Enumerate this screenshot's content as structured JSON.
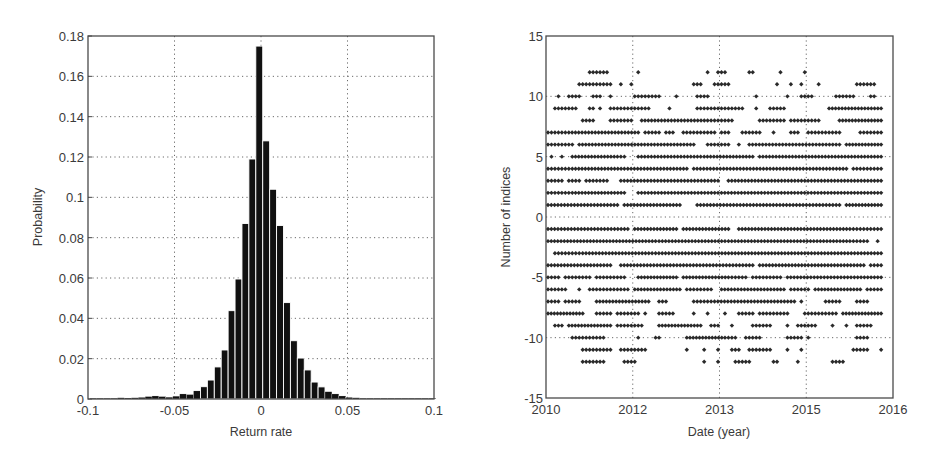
{
  "chart_data": [
    {
      "type": "bar",
      "subtype": "histogram",
      "title": "",
      "xlabel": "Return rate",
      "ylabel": "Probability",
      "xlim": [
        -0.1,
        0.1
      ],
      "ylim": [
        0,
        0.18
      ],
      "xticks": [
        "-0.1",
        "-0.05",
        "0",
        "0.05",
        "0.1"
      ],
      "xtick_values": [
        -0.1,
        -0.05,
        0,
        0.05,
        0.1
      ],
      "yticks": [
        "0",
        "0.02",
        "0.04",
        "0.06",
        "0.08",
        "0.1",
        "0.12",
        "0.14",
        "0.16",
        "0.18"
      ],
      "ytick_values": [
        0,
        0.02,
        0.04,
        0.06,
        0.08,
        0.1,
        0.12,
        0.14,
        0.16,
        0.18
      ],
      "grid": true,
      "bar_color": "#111111",
      "bin_width": 0.004,
      "bin_centers": [
        -0.097,
        -0.093,
        -0.089,
        -0.085,
        -0.081,
        -0.077,
        -0.073,
        -0.069,
        -0.065,
        -0.061,
        -0.057,
        -0.053,
        -0.049,
        -0.045,
        -0.041,
        -0.037,
        -0.033,
        -0.029,
        -0.025,
        -0.021,
        -0.017,
        -0.013,
        -0.009,
        -0.005,
        -0.001,
        0.003,
        0.007,
        0.011,
        0.015,
        0.019,
        0.023,
        0.027,
        0.031,
        0.035,
        0.039,
        0.043,
        0.047,
        0.051,
        0.055,
        0.059,
        0.063,
        0.067,
        0.071,
        0.075,
        0.079,
        0.083,
        0.087,
        0.091,
        0.095,
        0.099
      ],
      "values": [
        0.0003,
        0.0002,
        0.0003,
        0.0004,
        0.0006,
        0.0005,
        0.0006,
        0.0008,
        0.0012,
        0.0015,
        0.0012,
        0.0009,
        0.0014,
        0.0025,
        0.0022,
        0.004,
        0.0061,
        0.0094,
        0.0159,
        0.0243,
        0.0438,
        0.0595,
        0.087,
        0.119,
        0.175,
        0.128,
        0.104,
        0.086,
        0.0478,
        0.0289,
        0.0203,
        0.0144,
        0.0084,
        0.006,
        0.0036,
        0.0025,
        0.0015,
        0.0008,
        0.0006,
        0.0004,
        0.0003,
        0.0003,
        0.0003,
        0.0002,
        0.0004,
        0.0002,
        0.0002,
        0.0002,
        0.0003,
        0.0001
      ]
    },
    {
      "type": "scatter",
      "title": "",
      "xlabel": "Date (year)",
      "ylabel": "Number of indices",
      "xlim_frac": [
        0,
        1
      ],
      "ylim": [
        -15,
        15
      ],
      "xticks": [
        "2010",
        "2012",
        "2013",
        "2015",
        "2016"
      ],
      "xtick_fracs": [
        0,
        0.25,
        0.5,
        0.75,
        1.0
      ],
      "yticks": [
        "-15",
        "-10",
        "-5",
        "0",
        "5",
        "10",
        "15"
      ],
      "ytick_values": [
        -15,
        -10,
        -5,
        0,
        5,
        10,
        15
      ],
      "grid": true,
      "marker_color": "#2a2a2a",
      "marker": "diamond",
      "note": "Each row is an integer y-value; runs are [start,end] as fraction of x-axis width where markers are densely placed (single points when start==end).",
      "rows": [
        {
          "y": 12,
          "runs": [
            [
              0.12,
              0.17
            ],
            [
              0.26,
              0.26
            ],
            [
              0.46,
              0.46
            ],
            [
              0.49,
              0.51
            ],
            [
              0.58,
              0.59
            ],
            [
              0.67,
              0.67
            ],
            [
              0.74,
              0.74
            ]
          ]
        },
        {
          "y": 11,
          "runs": [
            [
              0.09,
              0.18
            ],
            [
              0.21,
              0.21
            ],
            [
              0.24,
              0.24
            ],
            [
              0.42,
              0.44
            ],
            [
              0.48,
              0.52
            ],
            [
              0.66,
              0.66
            ],
            [
              0.7,
              0.7
            ],
            [
              0.73,
              0.73
            ],
            [
              0.78,
              0.78
            ],
            [
              0.89,
              0.94
            ]
          ]
        },
        {
          "y": 10,
          "runs": [
            [
              0.03,
              0.03
            ],
            [
              0.06,
              0.09
            ],
            [
              0.13,
              0.15
            ],
            [
              0.18,
              0.18
            ],
            [
              0.25,
              0.32
            ],
            [
              0.37,
              0.37
            ],
            [
              0.43,
              0.46
            ],
            [
              0.6,
              0.6
            ],
            [
              0.69,
              0.69
            ],
            [
              0.73,
              0.76
            ],
            [
              0.83,
              0.88
            ],
            [
              0.93,
              0.94
            ]
          ]
        },
        {
          "y": 9,
          "runs": [
            [
              0.02,
              0.07
            ],
            [
              0.08,
              0.08
            ],
            [
              0.12,
              0.13
            ],
            [
              0.15,
              0.15
            ],
            [
              0.18,
              0.24
            ],
            [
              0.25,
              0.29
            ],
            [
              0.35,
              0.35
            ],
            [
              0.43,
              0.47
            ],
            [
              0.48,
              0.56
            ],
            [
              0.6,
              0.6
            ],
            [
              0.64,
              0.68
            ],
            [
              0.81,
              0.96
            ]
          ]
        },
        {
          "y": 8,
          "runs": [
            [
              0.1,
              0.13
            ],
            [
              0.18,
              0.24
            ],
            [
              0.27,
              0.46
            ],
            [
              0.47,
              0.53
            ],
            [
              0.61,
              0.68
            ],
            [
              0.7,
              0.78
            ],
            [
              0.84,
              0.96
            ]
          ]
        },
        {
          "y": 7,
          "runs": [
            [
              0.0,
              0.05
            ],
            [
              0.06,
              0.26
            ],
            [
              0.28,
              0.32
            ],
            [
              0.34,
              0.36
            ],
            [
              0.39,
              0.48
            ],
            [
              0.5,
              0.52
            ],
            [
              0.56,
              0.61
            ],
            [
              0.65,
              0.65
            ],
            [
              0.7,
              0.72
            ],
            [
              0.75,
              0.84
            ],
            [
              0.9,
              0.96
            ]
          ]
        },
        {
          "y": 6,
          "runs": [
            [
              0.0,
              0.07
            ],
            [
              0.09,
              0.42
            ],
            [
              0.46,
              0.49
            ],
            [
              0.5,
              0.52
            ],
            [
              0.55,
              0.55
            ],
            [
              0.58,
              0.84
            ],
            [
              0.86,
              0.96
            ]
          ]
        },
        {
          "y": 5,
          "runs": [
            [
              0.01,
              0.01
            ],
            [
              0.04,
              0.04
            ],
            [
              0.07,
              0.2
            ],
            [
              0.21,
              0.21
            ],
            [
              0.22,
              0.22
            ],
            [
              0.26,
              0.44
            ],
            [
              0.45,
              0.59
            ],
            [
              0.61,
              0.96
            ]
          ]
        },
        {
          "y": 4,
          "runs": [
            [
              0.0,
              0.06
            ],
            [
              0.07,
              0.22
            ],
            [
              0.23,
              0.4
            ],
            [
              0.42,
              0.86
            ],
            [
              0.88,
              0.96
            ]
          ]
        },
        {
          "y": 3,
          "runs": [
            [
              0.0,
              0.04
            ],
            [
              0.06,
              0.09
            ],
            [
              0.11,
              0.17
            ],
            [
              0.21,
              0.49
            ],
            [
              0.52,
              0.96
            ]
          ]
        },
        {
          "y": 2,
          "runs": [
            [
              0.0,
              0.06
            ],
            [
              0.07,
              0.22
            ],
            [
              0.26,
              0.49
            ],
            [
              0.5,
              0.96
            ]
          ]
        },
        {
          "y": 1,
          "runs": [
            [
              0.0,
              0.2
            ],
            [
              0.22,
              0.38
            ],
            [
              0.43,
              0.84
            ],
            [
              0.86,
              0.96
            ]
          ]
        },
        {
          "y": -1,
          "runs": [
            [
              0.0,
              0.23
            ],
            [
              0.25,
              0.37
            ],
            [
              0.39,
              0.52
            ],
            [
              0.55,
              0.87
            ],
            [
              0.88,
              0.96
            ]
          ]
        },
        {
          "y": -2,
          "runs": [
            [
              0.0,
              0.31
            ],
            [
              0.32,
              0.51
            ],
            [
              0.52,
              0.87
            ],
            [
              0.88,
              0.92
            ],
            [
              0.95,
              0.95
            ]
          ]
        },
        {
          "y": -3,
          "runs": [
            [
              0.02,
              0.09
            ],
            [
              0.1,
              0.3
            ],
            [
              0.31,
              0.96
            ]
          ]
        },
        {
          "y": -4,
          "runs": [
            [
              0.0,
              0.18
            ],
            [
              0.21,
              0.59
            ],
            [
              0.61,
              0.75
            ],
            [
              0.76,
              0.91
            ],
            [
              0.93,
              0.96
            ]
          ]
        },
        {
          "y": -5,
          "runs": [
            [
              0.0,
              0.03
            ],
            [
              0.05,
              0.12
            ],
            [
              0.14,
              0.22
            ],
            [
              0.26,
              0.37
            ],
            [
              0.39,
              0.52
            ],
            [
              0.53,
              0.57
            ],
            [
              0.59,
              0.67
            ],
            [
              0.69,
              0.96
            ]
          ]
        },
        {
          "y": -6,
          "runs": [
            [
              0.0,
              0.05
            ],
            [
              0.09,
              0.09
            ],
            [
              0.12,
              0.19
            ],
            [
              0.2,
              0.23
            ],
            [
              0.25,
              0.38
            ],
            [
              0.4,
              0.47
            ],
            [
              0.5,
              0.68
            ],
            [
              0.7,
              0.75
            ],
            [
              0.77,
              0.9
            ],
            [
              0.92,
              0.96
            ]
          ]
        },
        {
          "y": -7,
          "runs": [
            [
              0.0,
              0.03
            ],
            [
              0.05,
              0.09
            ],
            [
              0.14,
              0.29
            ],
            [
              0.32,
              0.34
            ],
            [
              0.42,
              0.47
            ],
            [
              0.48,
              0.71
            ],
            [
              0.73,
              0.73
            ],
            [
              0.8,
              0.84
            ],
            [
              0.89,
              0.92
            ]
          ]
        },
        {
          "y": -8,
          "runs": [
            [
              0.0,
              0.1
            ],
            [
              0.14,
              0.18
            ],
            [
              0.2,
              0.26
            ],
            [
              0.28,
              0.28
            ],
            [
              0.32,
              0.36
            ],
            [
              0.42,
              0.42
            ],
            [
              0.46,
              0.46
            ],
            [
              0.51,
              0.51
            ],
            [
              0.55,
              0.59
            ],
            [
              0.61,
              0.69
            ],
            [
              0.74,
              0.83
            ],
            [
              0.85,
              0.96
            ]
          ]
        },
        {
          "y": -9,
          "runs": [
            [
              0.02,
              0.04
            ],
            [
              0.06,
              0.18
            ],
            [
              0.2,
              0.27
            ],
            [
              0.32,
              0.44
            ],
            [
              0.47,
              0.49
            ],
            [
              0.53,
              0.53
            ],
            [
              0.59,
              0.64
            ],
            [
              0.69,
              0.69
            ],
            [
              0.72,
              0.77
            ],
            [
              0.82,
              0.82
            ],
            [
              0.86,
              0.86
            ],
            [
              0.89,
              0.93
            ]
          ]
        },
        {
          "y": -10,
          "runs": [
            [
              0.07,
              0.16
            ],
            [
              0.26,
              0.26
            ],
            [
              0.31,
              0.32
            ],
            [
              0.4,
              0.51
            ],
            [
              0.52,
              0.54
            ],
            [
              0.57,
              0.61
            ],
            [
              0.69,
              0.73
            ],
            [
              0.75,
              0.75
            ],
            [
              0.89,
              0.92
            ]
          ]
        },
        {
          "y": -11,
          "runs": [
            [
              0.1,
              0.18
            ],
            [
              0.21,
              0.28
            ],
            [
              0.4,
              0.4
            ],
            [
              0.45,
              0.45
            ],
            [
              0.49,
              0.49
            ],
            [
              0.53,
              0.55
            ],
            [
              0.58,
              0.64
            ],
            [
              0.69,
              0.69
            ],
            [
              0.73,
              0.73
            ],
            [
              0.88,
              0.92
            ],
            [
              0.96,
              0.96
            ]
          ]
        },
        {
          "y": -12,
          "runs": [
            [
              0.1,
              0.16
            ],
            [
              0.22,
              0.25
            ],
            [
              0.45,
              0.45
            ],
            [
              0.49,
              0.49
            ],
            [
              0.54,
              0.58
            ],
            [
              0.65,
              0.66
            ],
            [
              0.72,
              0.72
            ],
            [
              0.82,
              0.85
            ]
          ]
        }
      ]
    }
  ],
  "left_chart": {
    "xlabel": "Return rate",
    "ylabel": "Probability"
  },
  "right_chart": {
    "xlabel": "Date (year)",
    "ylabel": "Number of indices"
  }
}
